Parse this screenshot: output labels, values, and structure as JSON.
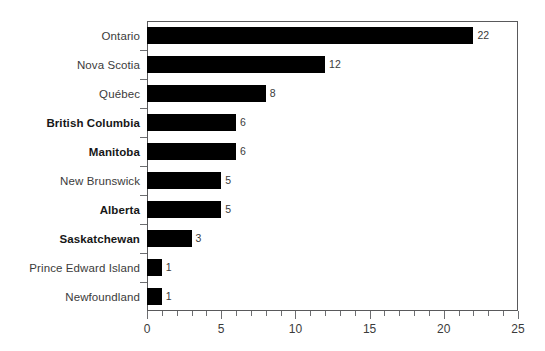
{
  "chart_data": {
    "type": "bar",
    "orientation": "horizontal",
    "title": "",
    "subtitle": "",
    "xlabel": "",
    "ylabel": "",
    "xlim": [
      0,
      25
    ],
    "xticks": [
      0,
      5,
      10,
      15,
      20,
      25
    ],
    "xtick_labels": [
      "0",
      "5",
      "10",
      "15",
      "20",
      "25"
    ],
    "minor_tick_step": 1,
    "grid": false,
    "legend": null,
    "bar_color": "#000000",
    "categories": [
      "Ontario",
      "Nova Scotia",
      "Québec",
      "British Columbia",
      "Manitoba",
      "New Brunswick",
      "Alberta",
      "Saskatchewan",
      "Prince Edward Island",
      "Newfoundland"
    ],
    "values": [
      22,
      12,
      8,
      6,
      6,
      5,
      5,
      3,
      1,
      1
    ],
    "value_labels": [
      "22",
      "12",
      "8",
      "6",
      "6",
      "5",
      "5",
      "3",
      "1",
      "1"
    ],
    "emphasized_categories": [
      "British Columbia",
      "Manitoba",
      "Alberta",
      "Saskatchewan"
    ],
    "bars": [
      {
        "category": "Ontario",
        "value": 22,
        "label": "22",
        "bold": false
      },
      {
        "category": "Nova Scotia",
        "value": 12,
        "label": "12",
        "bold": false
      },
      {
        "category": "Québec",
        "value": 8,
        "label": "8",
        "bold": false
      },
      {
        "category": "British Columbia",
        "value": 6,
        "label": "6",
        "bold": true
      },
      {
        "category": "Manitoba",
        "value": 6,
        "label": "6",
        "bold": true
      },
      {
        "category": "New Brunswick",
        "value": 5,
        "label": "5",
        "bold": false
      },
      {
        "category": "Alberta",
        "value": 5,
        "label": "5",
        "bold": true
      },
      {
        "category": "Saskatchewan",
        "value": 3,
        "label": "3",
        "bold": true
      },
      {
        "category": "Prince Edward Island",
        "value": 1,
        "label": "1",
        "bold": false
      },
      {
        "category": "Newfoundland",
        "value": 1,
        "label": "1",
        "bold": false
      }
    ]
  },
  "colors": {
    "background": "#ffffff",
    "bar": "#000000",
    "frame": "#59595b",
    "tick": "#6d6e71",
    "label": "#3b3b3b",
    "label_bold": "#171717"
  }
}
